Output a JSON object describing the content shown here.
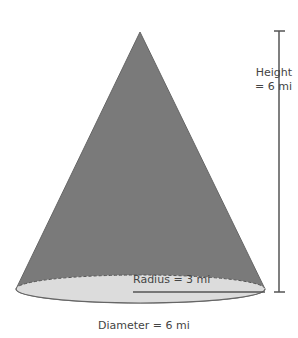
{
  "diagram": {
    "type": "cone",
    "labels": {
      "height_line1": "Height",
      "height_line2": "= 6 mi",
      "radius": "Radius = 3 mi",
      "diameter": "Diameter = 6 mi"
    },
    "colors": {
      "cone_fill": "#7a7a7a",
      "base_fill": "#dcdcdc",
      "line": "#555555"
    }
  }
}
